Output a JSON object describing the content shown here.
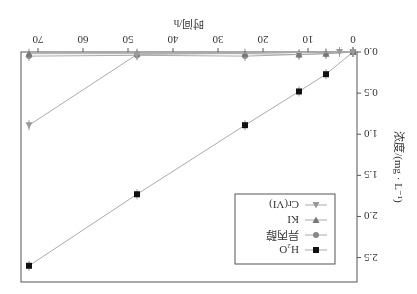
{
  "chart_data": {
    "type": "line",
    "title": "",
    "xlabel": "时间/h",
    "ylabel": "浓度/(mg · L⁻¹)",
    "xlim": [
      0,
      72
    ],
    "ylim": [
      0,
      2.7
    ],
    "xticks": [
      0,
      10,
      20,
      30,
      40,
      50,
      60,
      70
    ],
    "yticks": [
      0.0,
      0.5,
      1.0,
      1.5,
      2.0,
      2.5
    ],
    "legend_position": "inside-upper-left",
    "x": [
      0,
      3,
      6,
      12,
      24,
      48,
      72
    ],
    "series": [
      {
        "name": "H2O",
        "marker": "square",
        "color": "#111111",
        "x": [
          0,
          6,
          12,
          24,
          48,
          72
        ],
        "values": [
          0.0,
          0.27,
          0.48,
          0.89,
          1.73,
          2.6
        ]
      },
      {
        "name": "异丙醇",
        "marker": "circle",
        "color": "#888888",
        "x": [
          0,
          6,
          12,
          24,
          48,
          72
        ],
        "values": [
          0.0,
          0.02,
          0.03,
          0.05,
          0.04,
          0.05
        ]
      },
      {
        "name": "KI",
        "marker": "triangle-down",
        "color": "#777777",
        "x": [
          0,
          6,
          12,
          24,
          48,
          72
        ],
        "values": [
          0.0,
          0.02,
          0.03,
          0.02,
          0.02,
          0.02
        ]
      },
      {
        "name": "Cr(VI)",
        "marker": "triangle-up",
        "color": "#999999",
        "x": [
          0,
          3,
          48,
          72
        ],
        "values": [
          0.0,
          0.0,
          0.03,
          0.89
        ]
      }
    ]
  },
  "axes": {
    "xlabel": "时间/h",
    "ylabel": "浓度/(mg · L⁻¹)"
  },
  "legend": [
    "H₂O",
    "异丙醇",
    "KI",
    "Cr(VI)"
  ]
}
